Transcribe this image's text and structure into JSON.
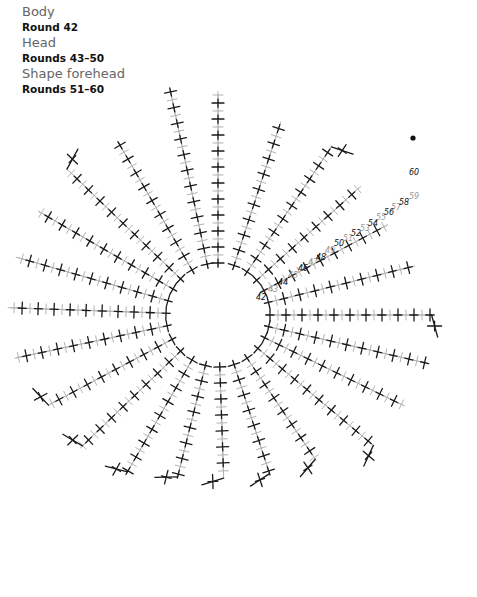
{
  "legend": [
    {
      "section": "Body",
      "rounds": "Round 42"
    },
    {
      "section": "Head",
      "rounds": "Rounds 43–50"
    },
    {
      "section": "Shape forehead",
      "rounds": "Rounds 51–60"
    }
  ],
  "colors": {
    "dark": "#1a1a1a",
    "light": "#b3b3b3",
    "label_dark": "#111111",
    "label_light": "#999999"
  },
  "center": {
    "x": 218,
    "y": 315,
    "r": 48
  },
  "rays": [
    {
      "a": 0,
      "len": 240,
      "end": "none"
    },
    {
      "a": -12,
      "len": 255,
      "end": "none"
    },
    {
      "a": 18,
      "len": 215,
      "end": "none"
    },
    {
      "a": 34,
      "len": 215,
      "end": "hook"
    },
    {
      "a": 48,
      "len": 200,
      "end": "none"
    },
    {
      "a": 62,
      "len": 200,
      "end": "none"
    },
    {
      "a": 76,
      "len": 215,
      "end": "none"
    },
    {
      "a": 90,
      "len": 230,
      "end": "hook"
    },
    {
      "a": 103,
      "len": 230,
      "end": "none"
    },
    {
      "a": 116,
      "len": 220,
      "end": "none"
    },
    {
      "a": 130,
      "len": 215,
      "end": "hook"
    },
    {
      "a": 146,
      "len": 175,
      "end": "hook"
    },
    {
      "a": 162,
      "len": 165,
      "end": "hook"
    },
    {
      "a": 178,
      "len": 160,
      "end": "hook"
    },
    {
      "a": 194,
      "len": 165,
      "end": "hook"
    },
    {
      "a": 210,
      "len": 185,
      "end": "hook"
    },
    {
      "a": 226,
      "len": 195,
      "end": "hook"
    },
    {
      "a": 242,
      "len": 200,
      "end": "hook"
    },
    {
      "a": 258,
      "len": 220,
      "end": "none"
    },
    {
      "a": 272,
      "len": 225,
      "end": "none"
    },
    {
      "a": 286,
      "len": 225,
      "end": "none"
    },
    {
      "a": 300,
      "len": 220,
      "end": "none"
    },
    {
      "a": 314,
      "len": 225,
      "end": "hook"
    },
    {
      "a": 330,
      "len": 210,
      "end": "labelled"
    }
  ],
  "round_labels": [
    {
      "text": "42",
      "x": 256,
      "y": 300,
      "dark": true
    },
    {
      "text": "43",
      "x": 268,
      "y": 292,
      "dark": false
    },
    {
      "text": "44",
      "x": 278,
      "y": 285,
      "dark": true
    },
    {
      "text": "45",
      "x": 288,
      "y": 278,
      "dark": false
    },
    {
      "text": "46",
      "x": 298,
      "y": 271,
      "dark": true
    },
    {
      "text": "47",
      "x": 308,
      "y": 265,
      "dark": false
    },
    {
      "text": "48",
      "x": 316,
      "y": 260,
      "dark": true
    },
    {
      "text": "49",
      "x": 325,
      "y": 253,
      "dark": false
    },
    {
      "text": "50",
      "x": 334,
      "y": 246,
      "dark": true
    },
    {
      "text": "51",
      "x": 343,
      "y": 241,
      "dark": false
    },
    {
      "text": "52",
      "x": 351,
      "y": 236,
      "dark": true
    },
    {
      "text": "53",
      "x": 360,
      "y": 231,
      "dark": false
    },
    {
      "text": "54",
      "x": 368,
      "y": 226,
      "dark": true
    },
    {
      "text": "55",
      "x": 376,
      "y": 220,
      "dark": false
    },
    {
      "text": "56",
      "x": 384,
      "y": 215,
      "dark": true
    },
    {
      "text": "57",
      "x": 391,
      "y": 210,
      "dark": false
    },
    {
      "text": "58",
      "x": 399,
      "y": 205,
      "dark": true
    },
    {
      "text": "59",
      "x": 409,
      "y": 199,
      "dark": false
    },
    {
      "text": "60",
      "x": 409,
      "y": 175,
      "dark": true
    }
  ],
  "marker_dot": {
    "x": 413,
    "y": 138
  }
}
